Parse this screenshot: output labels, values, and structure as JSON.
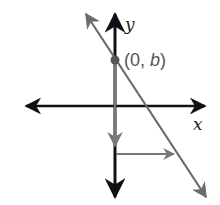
{
  "diagram": {
    "title": "",
    "axes": {
      "x_label": "x",
      "y_label": "y",
      "color": "#111111"
    },
    "line": {
      "color": "#6b6b6b",
      "description": "line with negative slope crossing y-axis at (0, b)"
    },
    "point": {
      "label_open": "(0, ",
      "label_var": "b",
      "label_close": ")",
      "color": "#555555"
    },
    "slope_arrows": {
      "rise": "down",
      "run": "right",
      "color": "#777777"
    }
  }
}
